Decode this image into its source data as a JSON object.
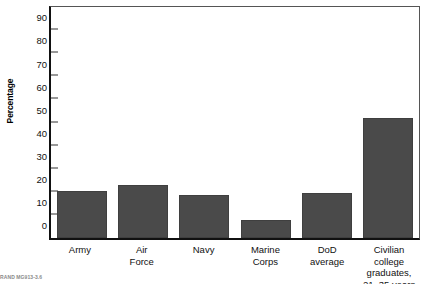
{
  "chart_data": {
    "type": "bar",
    "title": "",
    "xlabel": "",
    "ylabel": "Percentage",
    "ylim": [
      0,
      100
    ],
    "ytick_values": [
      100,
      90,
      80,
      70,
      60,
      50,
      40,
      30,
      20,
      10,
      0
    ],
    "ytick_labels": [
      "100",
      "90",
      "80",
      "70",
      "60",
      "50",
      "40",
      "30",
      "20",
      "10",
      "0"
    ],
    "grid": false,
    "legend": false,
    "bar_color": "#4a4a4a",
    "categories": [
      "Army",
      "Air Force",
      "Navy",
      "Marine Corps",
      "DoD average",
      "Civilian college graduates, 21–35 years"
    ],
    "category_lines": [
      [
        "Army"
      ],
      [
        "Air",
        "Force"
      ],
      [
        "Navy"
      ],
      [
        "Marine",
        "Corps"
      ],
      [
        "DoD",
        "average"
      ],
      [
        "Civilian college",
        "graduates,",
        "21–35 years"
      ]
    ],
    "values": [
      20.5,
      23,
      18.5,
      8,
      19.5,
      52
    ]
  },
  "source_note": "RAND MG913-3.6"
}
